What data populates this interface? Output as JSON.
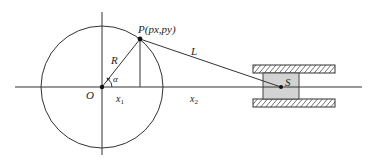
{
  "diagram": {
    "type": "slider-crank mechanism",
    "labels": {
      "point_p": "P(px,py)",
      "origin": "O",
      "radius": "R",
      "angle": "α",
      "rod": "L",
      "slider": "S",
      "x1_base": "x",
      "x1_sub": "1",
      "x2_base": "x",
      "x2_sub": "2"
    },
    "colors": {
      "line": "#333333",
      "slider_fill": "#d3d3d3",
      "hatch": "#333333",
      "background": "#ffffff"
    },
    "geometry": {
      "origin": [
        102,
        87
      ],
      "radius": 61,
      "point_p": [
        140,
        39
      ],
      "point_s": [
        281,
        87
      ],
      "slider_box": [
        263,
        73,
        36,
        26
      ],
      "guide_top": [
        253,
        65,
        82,
        8
      ],
      "guide_bottom": [
        253,
        99,
        82,
        8
      ]
    }
  }
}
